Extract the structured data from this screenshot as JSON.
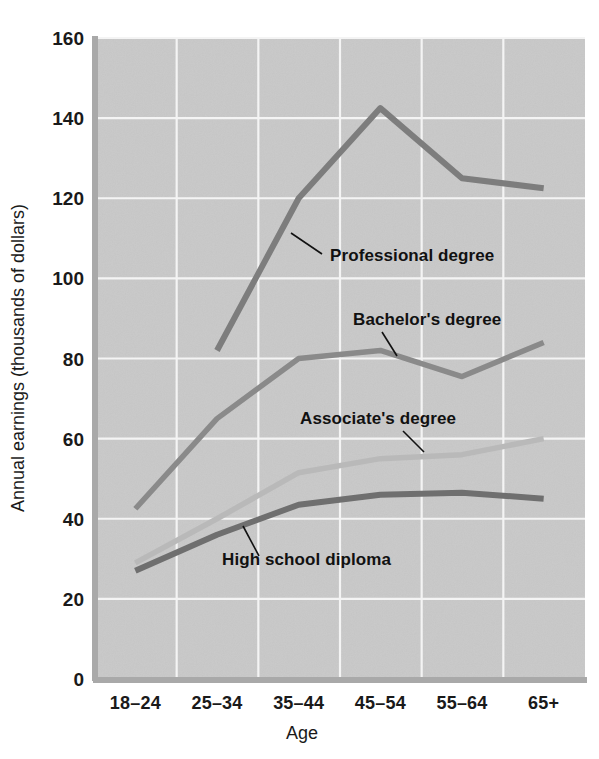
{
  "chart_data": {
    "type": "line",
    "title": "",
    "xlabel": "Age",
    "ylabel": "Annual earnings (thousands of dollars)",
    "categories": [
      "18–24",
      "25–34",
      "35–44",
      "45–54",
      "55–64",
      "65+"
    ],
    "ylim": [
      0,
      160
    ],
    "yticks": [
      0,
      20,
      40,
      60,
      80,
      100,
      120,
      140,
      160
    ],
    "ytick_labels": [
      "0",
      "20",
      "40",
      "60",
      "80",
      "100",
      "120",
      "140",
      "160"
    ],
    "grid": true,
    "legend_position": "inline-labels",
    "series": [
      {
        "name": "Professional degree",
        "color": "#7d7d7d",
        "stroke_width": 6,
        "values": [
          null,
          82,
          120,
          142.5,
          125,
          122.5
        ]
      },
      {
        "name": "Bachelor's degree",
        "color": "#8a8a8a",
        "stroke_width": 5.5,
        "values": [
          42.5,
          65,
          80,
          82,
          75.5,
          84
        ]
      },
      {
        "name": "Associate's degree",
        "color": "#b9b9b9",
        "stroke_width": 5.5,
        "values": [
          29,
          40,
          51.5,
          55,
          56,
          60
        ]
      },
      {
        "name": "High school diploma",
        "color": "#6f6f6f",
        "stroke_width": 6,
        "values": [
          27,
          36,
          43.5,
          46,
          46.5,
          45
        ]
      }
    ],
    "annotations": [
      {
        "text": "Professional degree",
        "x": 330,
        "y": 261,
        "leader_from": [
          322,
          254
        ],
        "leader_to": [
          291,
          233
        ],
        "anchor": "start"
      },
      {
        "text": "Bachelor's degree",
        "x": 353,
        "y": 325,
        "leader_from": [
          382,
          332
        ],
        "leader_to": [
          397,
          356
        ],
        "anchor": "start"
      },
      {
        "text": "Associate's degree",
        "x": 300,
        "y": 424,
        "leader_from": [
          403,
          431
        ],
        "leader_to": [
          424,
          452
        ],
        "anchor": "start"
      },
      {
        "text": "High school diploma",
        "x": 222,
        "y": 565,
        "leader_from": [
          259,
          556
        ],
        "leader_to": [
          243,
          526
        ],
        "anchor": "start"
      }
    ]
  },
  "axes": {
    "y_axis_title": "Annual earnings (thousands of dollars)",
    "x_axis_title": "Age"
  },
  "colors": {
    "plot_background": "#c9c9c9",
    "gridline": "#f4f4f4",
    "axis": "#a9a9a9",
    "text": "#1a1a1a",
    "professional": "#7d7d7d",
    "bachelors": "#8a8a8a",
    "associates": "#b9b9b9",
    "high_school": "#6f6f6f"
  }
}
